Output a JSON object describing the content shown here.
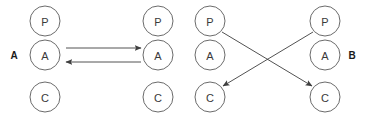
{
  "diagram": {
    "width": 365,
    "height": 122,
    "background_color": "#ffffff",
    "node_stroke_color": "#6b6b6b",
    "node_fill_color": "#ffffff",
    "node_text_color": "#3a3a3a",
    "edge_color": "#3f3f3f",
    "group_label_color": "#1a1a1a",
    "node_radius": 15,
    "columns": [
      {
        "id": "col-1",
        "cx": 45,
        "nodes": [
          {
            "id": "c1-p",
            "label": "P",
            "cy": 21
          },
          {
            "id": "c1-a",
            "label": "A",
            "cy": 55
          },
          {
            "id": "c1-c",
            "label": "C",
            "cy": 97
          }
        ]
      },
      {
        "id": "col-2",
        "cx": 158,
        "nodes": [
          {
            "id": "c2-p",
            "label": "P",
            "cy": 21
          },
          {
            "id": "c2-a",
            "label": "A",
            "cy": 55
          },
          {
            "id": "c2-c",
            "label": "C",
            "cy": 97
          }
        ]
      },
      {
        "id": "col-3",
        "cx": 210,
        "nodes": [
          {
            "id": "c3-p",
            "label": "P",
            "cy": 21
          },
          {
            "id": "c3-a",
            "label": "A",
            "cy": 55
          },
          {
            "id": "c3-c",
            "label": "C",
            "cy": 97
          }
        ]
      },
      {
        "id": "col-4",
        "cx": 325,
        "nodes": [
          {
            "id": "c4-p",
            "label": "P",
            "cy": 21
          },
          {
            "id": "c4-a",
            "label": "A",
            "cy": 55
          },
          {
            "id": "c4-c",
            "label": "C",
            "cy": 97
          }
        ]
      }
    ],
    "group_labels": [
      {
        "id": "group-a",
        "label": "A",
        "x": 14,
        "y": 55
      },
      {
        "id": "group-b",
        "label": "B",
        "x": 352,
        "y": 55
      }
    ],
    "edges": [
      {
        "id": "edge-a-forward",
        "kind": "horizontal",
        "from": "c1-a",
        "to": "c2-a",
        "x1": 66,
        "y1": 48,
        "x2": 141,
        "y2": 48
      },
      {
        "id": "edge-a-backward",
        "kind": "horizontal",
        "from": "c2-a",
        "to": "c1-a",
        "x1": 141,
        "y1": 62,
        "x2": 66,
        "y2": 62
      },
      {
        "id": "edge-p3-to-c4",
        "kind": "diagonal",
        "from": "c3-p",
        "to": "c4-c",
        "x1": 222,
        "y1": 32,
        "x2": 312,
        "y2": 86
      },
      {
        "id": "edge-p4-to-c3",
        "kind": "diagonal",
        "from": "c4-p",
        "to": "c3-c",
        "x1": 313,
        "y1": 32,
        "x2": 223,
        "y2": 86
      }
    ]
  }
}
